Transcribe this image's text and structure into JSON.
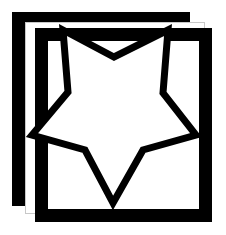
{
  "canvas": {
    "width": 226,
    "height": 235,
    "background": "#ffffff",
    "title": "Star outline logo on offset double square frames"
  },
  "palette": {
    "ink": "#000000",
    "paper": "#ffffff",
    "hairline": "#c8c8c8"
  },
  "layers": [
    {
      "name": "back-square-frame",
      "shape": "square-frame",
      "fill": "#000000",
      "x": 12,
      "y": 12,
      "width": 178,
      "height": 194,
      "stroke_width": 13
    },
    {
      "name": "paper-square",
      "shape": "square",
      "fill": "#ffffff",
      "stroke": "#c8c8c8",
      "x": 25,
      "y": 22,
      "width": 180,
      "height": 192,
      "stroke_width": 1
    },
    {
      "name": "front-square-frame",
      "shape": "square-frame",
      "fill": "#000000",
      "x": 35,
      "y": 28,
      "width": 177,
      "height": 194,
      "stroke_width": 13
    },
    {
      "name": "star-outline",
      "shape": "star-5-point",
      "fill": "#ffffff",
      "stroke": "#000000",
      "stroke_width": 7,
      "center_x": 114,
      "center_y": 120
    }
  ],
  "star": {
    "points": 5,
    "fill": "#ffffff",
    "stroke": "#000000",
    "stroke_width": 7,
    "outer_vertices": [
      {
        "label": "upper-left-point",
        "x": 63,
        "y": 30
      },
      {
        "label": "upper-right-point",
        "x": 168,
        "y": 30
      },
      {
        "label": "right-point",
        "x": 196,
        "y": 135
      },
      {
        "label": "bottom-point",
        "x": 113,
        "y": 203
      },
      {
        "label": "left-point",
        "x": 32,
        "y": 135
      }
    ],
    "inner_vertices": [
      {
        "label": "top-notch",
        "x": 114,
        "y": 57
      },
      {
        "label": "upper-right-notch",
        "x": 163,
        "y": 93
      },
      {
        "label": "lower-right-notch",
        "x": 143,
        "y": 150
      },
      {
        "label": "lower-left-notch",
        "x": 85,
        "y": 150
      },
      {
        "label": "upper-left-notch",
        "x": 68,
        "y": 92
      }
    ],
    "path": "M 63,30 L 114,57 L 168,30 L 163,93 L 196,135 L 143,150 L 113,203 L 85,150 L 32,135 L 68,92 Z"
  }
}
